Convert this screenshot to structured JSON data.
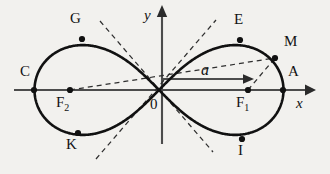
{
  "figure": {
    "type": "lemniscate-of-bernoulli-diagram",
    "background_color": "#f2f1ee",
    "ink_color": "#131313",
    "axes": {
      "x_label": "x",
      "y_label": "y",
      "origin_label": "0"
    },
    "vector": {
      "label": "a",
      "from": "origin",
      "to": "F1"
    },
    "points": [
      {
        "name": "C",
        "label": "C",
        "x": 34,
        "y": 90,
        "label_x": 20,
        "label_y": 64,
        "dot": true
      },
      {
        "name": "G",
        "label": "G",
        "x": 82,
        "y": 39,
        "label_x": 70,
        "label_y": 11,
        "dot": true
      },
      {
        "name": "K",
        "label": "K",
        "x": 78,
        "y": 133,
        "label_x": 66,
        "label_y": 137,
        "dot": true
      },
      {
        "name": "F2",
        "label": "F",
        "sub": "2",
        "x": 70,
        "y": 90,
        "label_x": 56,
        "label_y": 95,
        "dot": true
      },
      {
        "name": "O",
        "label": "0",
        "x": 162,
        "y": 90,
        "label_x": 150,
        "label_y": 97,
        "dot": false
      },
      {
        "name": "E",
        "label": "E",
        "x": 240,
        "y": 40,
        "label_x": 234,
        "label_y": 12,
        "dot": true
      },
      {
        "name": "I",
        "label": "I",
        "x": 242,
        "y": 139,
        "label_x": 238,
        "label_y": 143,
        "dot": true
      },
      {
        "name": "M",
        "label": "M",
        "x": 275,
        "y": 58,
        "label_x": 284,
        "label_y": 34,
        "dot": true
      },
      {
        "name": "F1",
        "label": "F",
        "sub": "1",
        "x": 248,
        "y": 90,
        "label_x": 236,
        "label_y": 95,
        "dot": true
      },
      {
        "name": "A",
        "label": "A",
        "x": 283,
        "y": 90,
        "label_x": 288,
        "label_y": 64,
        "dot": true
      }
    ],
    "dashed_lines": [
      {
        "name": "focal-radius-F2-M",
        "from": "F2",
        "to": "M"
      },
      {
        "name": "focal-radius-F1-M",
        "from": "F1",
        "to": "M"
      },
      {
        "name": "asymptote-up-left",
        "from_x": 100,
        "from_y": 21,
        "to_x": 213,
        "to_y": 152
      },
      {
        "name": "asymptote-down-left",
        "from_x": 96,
        "from_y": 159,
        "to_x": 216,
        "to_y": 20
      }
    ],
    "curve": {
      "name": "lemniscate",
      "half_width": 124.5,
      "center_x": 159,
      "center_y": 90,
      "vertical_scale": 1.02
    }
  }
}
